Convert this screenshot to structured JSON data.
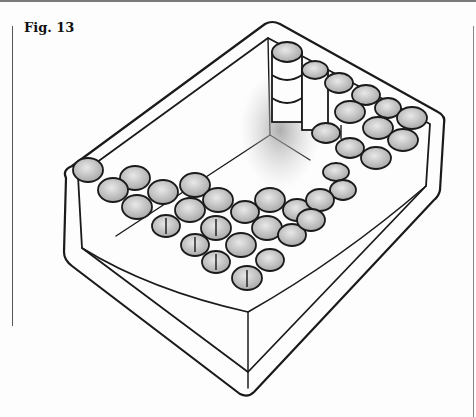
{
  "figure": {
    "label": "Fig. 13"
  },
  "colors": {
    "ink": "#1a1a1a",
    "shade": "#bdbdbd",
    "paper": "#fdfdfd"
  }
}
